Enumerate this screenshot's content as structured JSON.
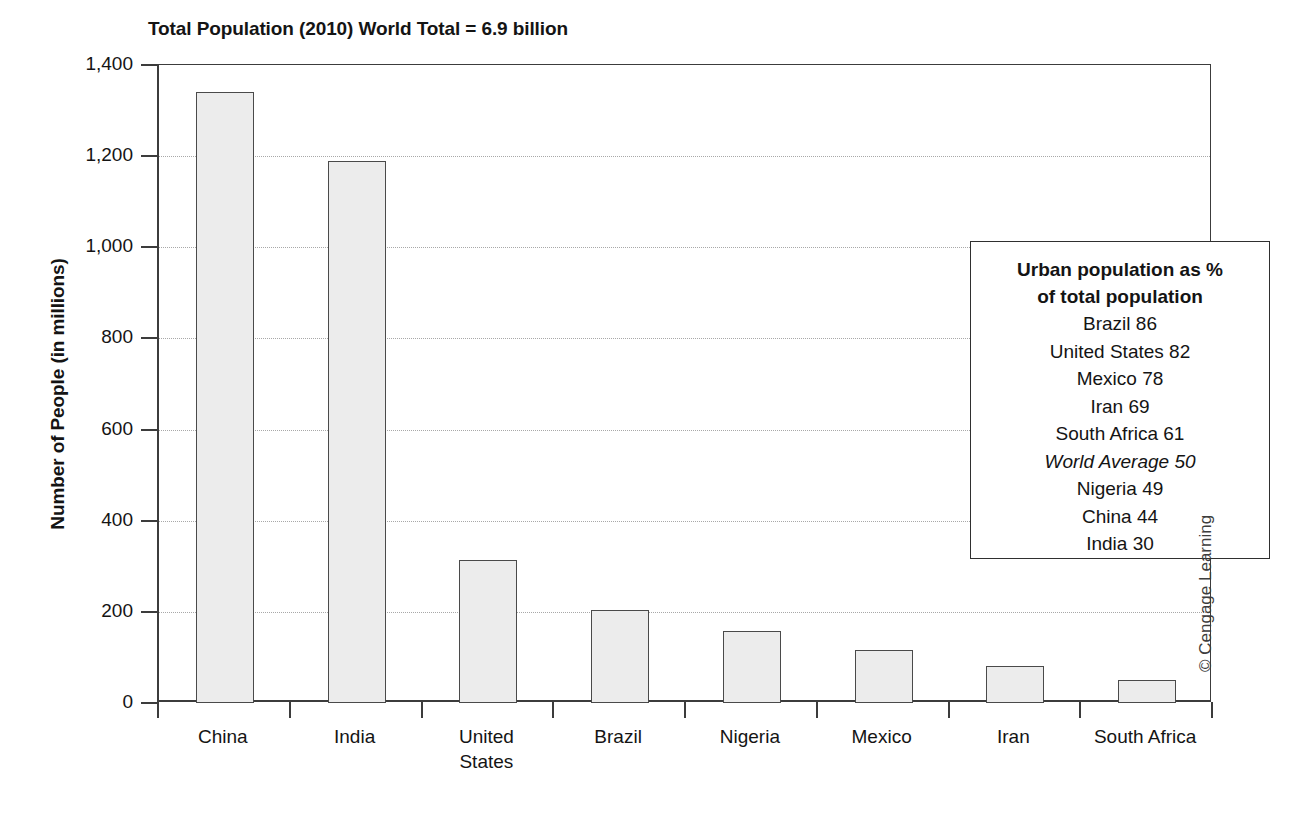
{
  "chart_data": {
    "type": "bar",
    "title": "Total Population (2010) World Total = 6.9 billion",
    "xlabel": "",
    "ylabel": "Number of People (in millions)",
    "ylim": [
      0,
      1400
    ],
    "ytick_step": 200,
    "ytick_labels": [
      "1,400",
      "1,200",
      "1,000",
      "800",
      "600",
      "400",
      "200",
      "0"
    ],
    "ytick_values": [
      1400,
      1200,
      1000,
      800,
      600,
      400,
      200,
      0
    ],
    "grid": "horizontal-dotted",
    "legend_position": "inside-upper-right",
    "categories": [
      "China",
      "India",
      "United States",
      "Brazil",
      "Nigeria",
      "Mexico",
      "Iran",
      "South Africa"
    ],
    "values": [
      1340,
      1190,
      313,
      205,
      158,
      116,
      82,
      51
    ],
    "bar_fill_color": "#ececec",
    "bar_border_color": "#4a4a4a"
  },
  "annotation_box": {
    "heading_line1": "Urban population as %",
    "heading_line2": "of total population",
    "rows": [
      {
        "label": "Brazil 86",
        "italic": false
      },
      {
        "label": "United States 82",
        "italic": false
      },
      {
        "label": "Mexico 78",
        "italic": false
      },
      {
        "label": "Iran 69",
        "italic": false
      },
      {
        "label": "South Africa 61",
        "italic": false
      },
      {
        "label": "World Average 50",
        "italic": true
      },
      {
        "label": "Nigeria 49",
        "italic": false
      },
      {
        "label": "China 44",
        "italic": false
      },
      {
        "label": "India 30",
        "italic": false
      }
    ]
  },
  "credit": "© Cengage Learning"
}
